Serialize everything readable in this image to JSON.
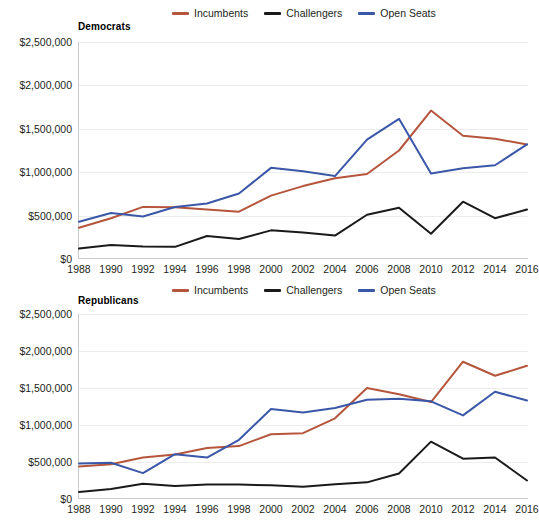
{
  "chart_data": [
    {
      "type": "line",
      "title": "Democrats",
      "xlabel": "",
      "ylabel": "",
      "xlim": [
        1988,
        2016
      ],
      "ylim": [
        0,
        2500000
      ],
      "grid": true,
      "legend_position": "top",
      "categories": [
        1988,
        1990,
        1992,
        1994,
        1996,
        1998,
        2000,
        2002,
        2004,
        2006,
        2008,
        2010,
        2012,
        2014,
        2016
      ],
      "x_tick_labels": [
        "1988",
        "1990",
        "1992",
        "1994",
        "1996",
        "1998",
        "2000",
        "2002",
        "2004",
        "2006",
        "2008",
        "2010",
        "2012",
        "2014",
        "2016"
      ],
      "y_tick_labels": [
        "$0",
        "$500,000",
        "$1,000,000",
        "$1,500,000",
        "$2,000,000",
        "$2,500,000"
      ],
      "y_tick_values": [
        0,
        500000,
        1000000,
        1500000,
        2000000,
        2500000
      ],
      "series": [
        {
          "name": "Incumbents",
          "color": "#b5563c",
          "values": [
            360000,
            470000,
            600000,
            595000,
            570000,
            545000,
            730000,
            840000,
            930000,
            980000,
            1250000,
            1710000,
            1420000,
            1385000,
            1320000
          ]
        },
        {
          "name": "Challengers",
          "color": "#1a1a1a",
          "values": [
            120000,
            160000,
            145000,
            140000,
            265000,
            230000,
            330000,
            305000,
            270000,
            510000,
            590000,
            290000,
            660000,
            470000,
            570000
          ]
        },
        {
          "name": "Open Seats",
          "color": "#3b57a8",
          "values": [
            430000,
            530000,
            490000,
            600000,
            640000,
            755000,
            1050000,
            1010000,
            955000,
            1375000,
            1615000,
            985000,
            1045000,
            1080000,
            1320000
          ]
        }
      ]
    },
    {
      "type": "line",
      "title": "Republicans",
      "xlabel": "",
      "ylabel": "",
      "xlim": [
        1988,
        2016
      ],
      "ylim": [
        0,
        2500000
      ],
      "grid": true,
      "legend_position": "top",
      "categories": [
        1988,
        1990,
        1992,
        1994,
        1996,
        1998,
        2000,
        2002,
        2004,
        2006,
        2008,
        2010,
        2012,
        2014,
        2016
      ],
      "x_tick_labels": [
        "1988",
        "1990",
        "1992",
        "1994",
        "1996",
        "1998",
        "2000",
        "2002",
        "2004",
        "2006",
        "2008",
        "2010",
        "2012",
        "2014",
        "2016"
      ],
      "y_tick_labels": [
        "$0",
        "$500,000",
        "$1,000,000",
        "$1,500,000",
        "$2,000,000",
        "$2,500,000"
      ],
      "y_tick_values": [
        0,
        500000,
        1000000,
        1500000,
        2000000,
        2500000
      ],
      "series": [
        {
          "name": "Incumbents",
          "color": "#b5563c",
          "values": [
            440000,
            470000,
            560000,
            600000,
            690000,
            715000,
            875000,
            890000,
            1090000,
            1500000,
            1415000,
            1310000,
            1855000,
            1665000,
            1800000
          ]
        },
        {
          "name": "Challengers",
          "color": "#1a1a1a",
          "values": [
            95000,
            135000,
            205000,
            175000,
            195000,
            195000,
            185000,
            165000,
            200000,
            225000,
            345000,
            775000,
            545000,
            560000,
            250000
          ]
        },
        {
          "name": "Open Seats",
          "color": "#3b57a8",
          "values": [
            480000,
            490000,
            350000,
            605000,
            560000,
            800000,
            1215000,
            1170000,
            1230000,
            1340000,
            1355000,
            1320000,
            1130000,
            1450000,
            1330000
          ]
        }
      ]
    }
  ],
  "legend": {
    "items": [
      {
        "label": "Incumbents",
        "color": "#b5563c"
      },
      {
        "label": "Challengers",
        "color": "#1a1a1a"
      },
      {
        "label": "Open Seats",
        "color": "#3b57a8"
      }
    ]
  },
  "colors": {
    "incumbents": "#b5563c",
    "challengers": "#1a1a1a",
    "open_seats": "#3b57a8",
    "axis": "#c9ccce",
    "gridline": "#eceded",
    "text": "#231f20",
    "background": "#ffffff"
  }
}
